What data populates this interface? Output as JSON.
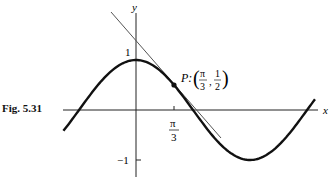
{
  "figure": {
    "label": "Fig. 5.31",
    "axis_x_label": "x",
    "axis_y_label": "y",
    "tick_y_pos": "1",
    "tick_y_neg": "−1",
    "tick_x_num": "π",
    "tick_x_den": "3",
    "point_label": "P:",
    "point_x_num": "π",
    "point_x_den": "3",
    "point_y_num": "1",
    "point_y_den": "2"
  },
  "chart_data": {
    "type": "line",
    "title": "",
    "series": [
      {
        "name": "y = cos x",
        "function": "cos(x)",
        "x_range": [
          -2.0,
          4.93
        ]
      },
      {
        "name": "tangent at P",
        "function": "1/2 - (sqrt(3)/2)(x - pi/3)"
      }
    ],
    "annotations": [
      {
        "label": "P: (π/3, 1/2)",
        "x": 1.0472,
        "y": 0.5
      }
    ],
    "xlabel": "x",
    "ylabel": "y",
    "x_ticks": [
      "π/3"
    ],
    "y_ticks": [
      "1",
      "-1"
    ],
    "grid": false
  }
}
